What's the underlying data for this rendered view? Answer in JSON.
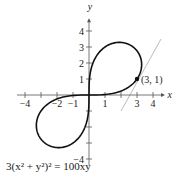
{
  "chart_data": {
    "type": "line",
    "title": "",
    "equation": "3(x² + y²)² = 100xy",
    "xlabel": "x",
    "ylabel": "y",
    "xlim": [
      -4.5,
      4.5
    ],
    "ylim": [
      -4.5,
      4.5
    ],
    "x_ticks": [
      -4,
      -3,
      -2,
      -1,
      1,
      2,
      3,
      4
    ],
    "x_tick_labels": [
      "-4",
      "-2",
      "-1",
      "1",
      "3",
      "4"
    ],
    "y_ticks": [
      -4,
      -3,
      -2,
      -1,
      1,
      2,
      3,
      4
    ],
    "y_tick_labels": [
      "4",
      "3",
      "2",
      "1",
      "-4"
    ],
    "series": [
      {
        "name": "lemniscate",
        "curve": "3(x^2+y^2)^2=100xy",
        "color": "#111111"
      },
      {
        "name": "tangent line at (3,1)",
        "points": [
          [
            2,
            -1
          ],
          [
            4.5,
            3.5
          ]
        ],
        "color": "#aaaaaa"
      }
    ],
    "annotations": [
      {
        "point": [
          3,
          1
        ],
        "label": "(3, 1)"
      }
    ],
    "grid": false
  },
  "caption": {
    "equation": "3(x² + y²)² = 100xy",
    "cut_text": "1 ... 1 ..."
  }
}
